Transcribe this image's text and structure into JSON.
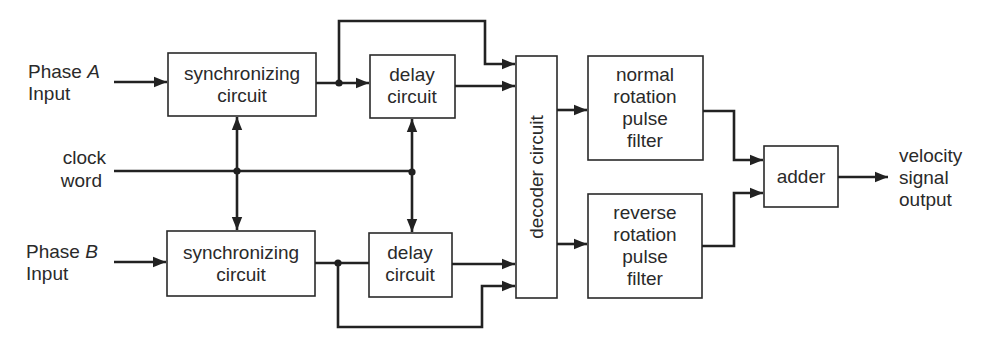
{
  "diagram": {
    "type": "block-diagram",
    "inputs": {
      "phase_a": {
        "line1": "Phase ",
        "phase_letter": "A",
        "line2": "Input"
      },
      "clock": {
        "line1": "clock",
        "line2": "word"
      },
      "phase_b": {
        "line1": "Phase ",
        "phase_letter": "B",
        "line2": "Input"
      }
    },
    "blocks": {
      "sync_a": {
        "line1": "synchronizing",
        "line2": "circuit"
      },
      "delay_a": {
        "line1": "delay",
        "line2": "circuit"
      },
      "sync_b": {
        "line1": "synchronizing",
        "line2": "circuit"
      },
      "delay_b": {
        "line1": "delay",
        "line2": "circuit"
      },
      "decoder": {
        "label": "decoder circuit"
      },
      "normal_filter": {
        "line1": "normal",
        "line2": "rotation",
        "line3": "pulse",
        "line4": "filter"
      },
      "reverse_filter": {
        "line1": "reverse",
        "line2": "rotation",
        "line3": "pulse",
        "line4": "filter"
      },
      "adder": {
        "label": "adder"
      }
    },
    "output": {
      "line1": "velocity",
      "line2": "signal",
      "line3": "output"
    },
    "colors": {
      "line": "#222222",
      "box_stroke": "#2a2a2a",
      "text": "#2a2a2a",
      "background": "#ffffff"
    }
  }
}
